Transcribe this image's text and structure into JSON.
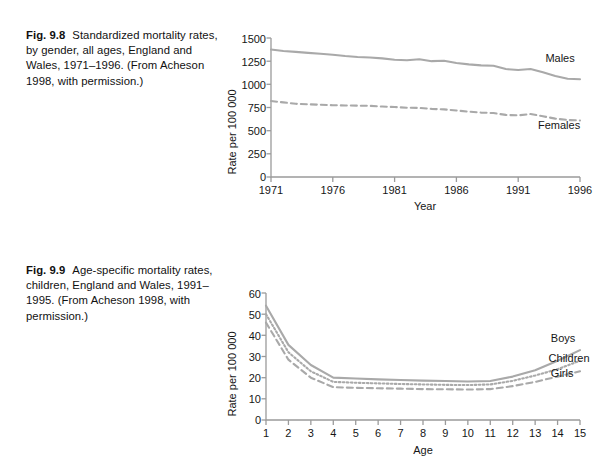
{
  "page": {
    "background": "#ffffff",
    "line_color": "#a9a9a9",
    "axis_color": "#9b9b9b",
    "text_color": "#161616"
  },
  "figures": [
    {
      "id": "fig-9-8",
      "caption_number": "Fig. 9.8",
      "caption_text": "Standardized mortality rates, by gender, all ages, England and Wales, 1971–1996. (From Acheson 1998, with permission.)",
      "chart_data": {
        "type": "line",
        "title": "",
        "xlabel": "Year",
        "ylabel": "Rate per 100 000",
        "xlim": [
          1971,
          1996
        ],
        "ylim": [
          0,
          1500
        ],
        "xticks": [
          1971,
          1976,
          1981,
          1986,
          1991,
          1996
        ],
        "yticks": [
          0,
          250,
          500,
          750,
          1000,
          1250,
          1500
        ],
        "xticklabels": [
          "1971",
          "1976",
          "1981",
          "1986",
          "1991",
          "1996"
        ],
        "yticklabels": [
          "0",
          "250",
          "500",
          "750",
          "1000",
          "1250",
          "1500"
        ],
        "grid": false,
        "legend_position": "inline-right",
        "x": [
          1971,
          1972,
          1973,
          1974,
          1975,
          1976,
          1977,
          1978,
          1979,
          1980,
          1981,
          1982,
          1983,
          1984,
          1985,
          1986,
          1987,
          1988,
          1989,
          1990,
          1991,
          1992,
          1993,
          1994,
          1995,
          1996
        ],
        "series": [
          {
            "name": "Males",
            "style": "solid",
            "values": [
              1375,
              1360,
              1350,
              1340,
              1330,
              1320,
              1305,
              1295,
              1290,
              1280,
              1265,
              1260,
              1270,
              1250,
              1255,
              1230,
              1215,
              1205,
              1200,
              1165,
              1155,
              1165,
              1130,
              1090,
              1060,
              1055
            ]
          },
          {
            "name": "Females",
            "style": "dashed",
            "values": [
              820,
              805,
              790,
              785,
              780,
              775,
              772,
              770,
              768,
              760,
              755,
              748,
              745,
              735,
              730,
              718,
              705,
              695,
              690,
              670,
              665,
              680,
              655,
              630,
              615,
              610
            ]
          }
        ],
        "annotations": [
          {
            "text": "Males",
            "x": 1993.2,
            "y": 1245
          },
          {
            "text": "Females",
            "x": 1992.6,
            "y": 520
          }
        ]
      }
    },
    {
      "id": "fig-9-9",
      "caption_number": "Fig. 9.9",
      "caption_text": "Age-specific mortality rates, children, England and Wales, 1991–1995. (From Acheson 1998, with permission.)",
      "chart_data": {
        "type": "line",
        "title": "",
        "xlabel": "Age",
        "ylabel": "Rate per 100 000",
        "xlim": [
          1,
          15
        ],
        "ylim": [
          0,
          60
        ],
        "xticks": [
          1,
          2,
          3,
          4,
          5,
          6,
          7,
          8,
          9,
          10,
          11,
          12,
          13,
          14,
          15
        ],
        "yticks": [
          0,
          10,
          20,
          30,
          40,
          50,
          60
        ],
        "xticklabels": [
          "1",
          "2",
          "3",
          "4",
          "5",
          "6",
          "7",
          "8",
          "9",
          "10",
          "11",
          "12",
          "13",
          "14",
          "15"
        ],
        "yticklabels": [
          "0",
          "10",
          "20",
          "30",
          "40",
          "50",
          "60"
        ],
        "grid": false,
        "legend_position": "inline-right",
        "x": [
          1,
          2,
          3,
          4,
          5,
          6,
          7,
          8,
          9,
          10,
          11,
          12,
          13,
          14,
          15
        ],
        "series": [
          {
            "name": "Boys",
            "style": "solid",
            "values": [
              54,
              35.5,
              26,
              20,
              19.6,
              19.2,
              18.9,
              18.6,
              18.4,
              18.2,
              18.4,
              20.5,
              23.5,
              28,
              33
            ]
          },
          {
            "name": "Children",
            "style": "dotted",
            "values": [
              50,
              32,
              23,
              18,
              17.6,
              17.3,
              17.0,
              16.8,
              16.6,
              16.5,
              16.8,
              18.5,
              21,
              24,
              28
            ]
          },
          {
            "name": "Girls",
            "style": "dashed",
            "values": [
              46,
              28.5,
              20,
              15.5,
              15.2,
              15.0,
              14.8,
              14.6,
              14.5,
              14.4,
              14.6,
              16,
              18,
              20.5,
              23
            ]
          }
        ],
        "annotations": [
          {
            "text": "Boys",
            "x": 13.7,
            "y": 37
          },
          {
            "text": "Children",
            "x": 13.6,
            "y": 27.5
          },
          {
            "text": "Girls",
            "x": 13.7,
            "y": 20.5
          }
        ]
      }
    }
  ]
}
